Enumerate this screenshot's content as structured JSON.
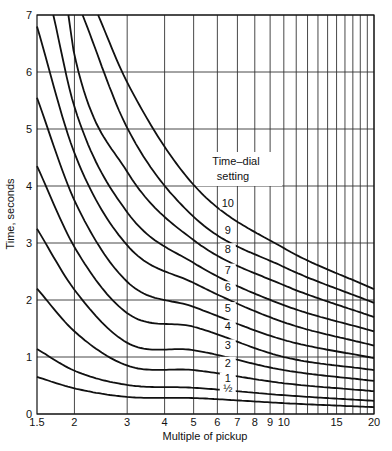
{
  "chart_data": {
    "type": "line",
    "title": "",
    "caption": "Fig. (caption cropped)",
    "xlabel": "Multiple of pickup",
    "ylabel": "Time, seconds",
    "xscale": "log",
    "xlim": [
      1.5,
      20
    ],
    "ylim": [
      0,
      7
    ],
    "grid": true,
    "x_ticks": [
      1.5,
      2,
      3,
      4,
      5,
      6,
      7,
      8,
      9,
      10,
      15,
      20
    ],
    "x_tick_labels": [
      "1.5",
      "2",
      "3",
      "4",
      "5",
      "6",
      "7",
      "8",
      "9",
      "10",
      "15",
      "20"
    ],
    "x_gridlines": [
      2,
      3,
      4,
      5,
      6,
      7,
      8,
      9,
      10,
      11,
      12,
      13,
      14,
      15,
      16,
      17,
      18,
      19,
      20
    ],
    "y_ticks": [
      0,
      1,
      2,
      3,
      4,
      5,
      6,
      7
    ],
    "y_tick_labels": [
      "0",
      "1",
      "2",
      "3",
      "4",
      "5",
      "6",
      "7"
    ],
    "legend": {
      "title_line1": "Time–dial",
      "title_line2": "setting",
      "position": "center, labels placed on curves near x≈6.5"
    },
    "series": [
      {
        "name": "1/2",
        "label": "½",
        "x": [
          1.5,
          2,
          3,
          5,
          10,
          20
        ],
        "y": [
          0.65,
          0.45,
          0.3,
          0.28,
          0.19,
          0.12
        ]
      },
      {
        "name": "1",
        "label": "1",
        "x": [
          1.5,
          2,
          3,
          5,
          10,
          20
        ],
        "y": [
          1.14,
          0.76,
          0.51,
          0.46,
          0.33,
          0.23
        ]
      },
      {
        "name": "2",
        "label": "2",
        "x": [
          1.5,
          2,
          3,
          5,
          10,
          20
        ],
        "y": [
          2.2,
          1.45,
          0.85,
          0.77,
          0.54,
          0.4
        ]
      },
      {
        "name": "3",
        "label": "3",
        "x": [
          1.5,
          2,
          3,
          5,
          10,
          20
        ],
        "y": [
          3.25,
          2.18,
          1.25,
          1.12,
          0.77,
          0.58
        ]
      },
      {
        "name": "4",
        "label": "4",
        "x": [
          1.5,
          2,
          3,
          5,
          10,
          20
        ],
        "y": [
          4.35,
          2.93,
          1.77,
          1.53,
          1.0,
          0.77
        ]
      },
      {
        "name": "5",
        "label": "5",
        "x": [
          1.5,
          2,
          3,
          5,
          10,
          20
        ],
        "y": [
          5.55,
          3.75,
          2.32,
          1.88,
          1.3,
          0.98
        ]
      },
      {
        "name": "6",
        "label": "6",
        "x": [
          1.5,
          2,
          3,
          5,
          10,
          20
        ],
        "y": [
          6.8,
          4.58,
          2.96,
          2.3,
          1.61,
          1.2
        ]
      },
      {
        "name": "7",
        "label": "7",
        "x": [
          1.7,
          2,
          3,
          5,
          10,
          20
        ],
        "y": [
          7.0,
          5.39,
          3.54,
          2.65,
          1.91,
          1.45
        ]
      },
      {
        "name": "8",
        "label": "8",
        "x": [
          1.91,
          2,
          3,
          5,
          10,
          20
        ],
        "y": [
          7.0,
          6.3,
          4.25,
          3.05,
          2.26,
          1.7
        ]
      },
      {
        "name": "9",
        "label": "9",
        "x": [
          2.13,
          3,
          5,
          10,
          20
        ],
        "y": [
          7.0,
          5.02,
          3.46,
          2.58,
          1.95
        ]
      },
      {
        "name": "10",
        "label": "10",
        "x": [
          2.4,
          3,
          5,
          10,
          20
        ],
        "y": [
          7.0,
          5.82,
          4.02,
          2.91,
          2.19
        ]
      }
    ]
  }
}
